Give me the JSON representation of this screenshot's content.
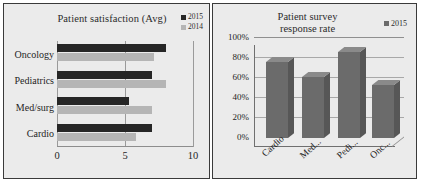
{
  "charts": [
    {
      "id": "patient-satisfaction",
      "title": "Patient satisfaction (Avg)",
      "legend": [
        {
          "label": "2015",
          "color": "#262626"
        },
        {
          "label": "2014",
          "color": "#b5b5b5"
        }
      ],
      "categories": [
        "Oncology",
        "Pediatrics",
        "Med/surg",
        "Cardio"
      ],
      "xticks": [
        "0",
        "5",
        "10"
      ]
    },
    {
      "id": "patient-survey-response-rate",
      "title_line1": "Patient survey",
      "title_line2": "response rate",
      "legend": [
        {
          "label": "2015",
          "color": "#6b6b6b"
        }
      ],
      "yticks": [
        "100%",
        "80%",
        "60%",
        "40%",
        "20%",
        "0%"
      ],
      "categories": [
        "Cardio",
        "Med...",
        "Pedi...",
        "Onc..."
      ]
    }
  ],
  "chart_data": [
    {
      "type": "bar",
      "orientation": "horizontal",
      "title": "Patient satisfaction (Avg)",
      "xlabel": "",
      "ylabel": "",
      "xlim": [
        0,
        10
      ],
      "xticks": [
        0,
        5,
        10
      ],
      "grid": true,
      "legend_position": "top-right",
      "categories": [
        "Oncology",
        "Pediatrics",
        "Med/surg",
        "Cardio"
      ],
      "series": [
        {
          "name": "2015",
          "color": "#262626",
          "values": [
            8.0,
            7.0,
            5.3,
            7.0
          ]
        },
        {
          "name": "2014",
          "color": "#b5b5b5",
          "values": [
            7.1,
            8.0,
            7.0,
            5.8
          ]
        }
      ]
    },
    {
      "type": "bar",
      "orientation": "vertical",
      "style": "3d-column",
      "title": "Patient survey response rate",
      "xlabel": "",
      "ylabel": "",
      "ylim": [
        0,
        100
      ],
      "yticks": [
        0,
        20,
        40,
        60,
        80,
        100
      ],
      "ytick_labels": [
        "0%",
        "20%",
        "40%",
        "60%",
        "80%",
        "100%"
      ],
      "grid": true,
      "legend_position": "top-right",
      "categories": [
        "Cardio",
        "Med...",
        "Pedi...",
        "Onc..."
      ],
      "series": [
        {
          "name": "2015",
          "color": "#6b6b6b",
          "values": [
            75,
            60,
            85,
            52
          ]
        }
      ]
    }
  ]
}
